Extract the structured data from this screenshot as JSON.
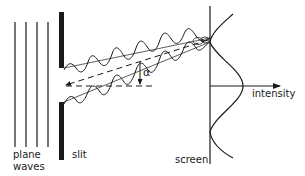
{
  "diagram": {
    "labels": {
      "plane_line1": "plane",
      "plane_line2": "waves",
      "slit": "slit",
      "screen": "screen",
      "intensity": "intensity",
      "angle": "α"
    },
    "elements": {
      "plane_wave_lines": [
        15,
        26,
        37,
        48
      ],
      "slit_top_segment": {
        "x": 60,
        "y1": 12,
        "y2": 68
      },
      "slit_bottom_segment": {
        "x": 60,
        "y1": 102,
        "y2": 160
      },
      "screen_x": 210,
      "convergence_point": {
        "x": 210,
        "y": 40
      },
      "axis_y": 86
    },
    "colors": {
      "ink": "#1a1a1a",
      "background": "#ffffff"
    }
  }
}
